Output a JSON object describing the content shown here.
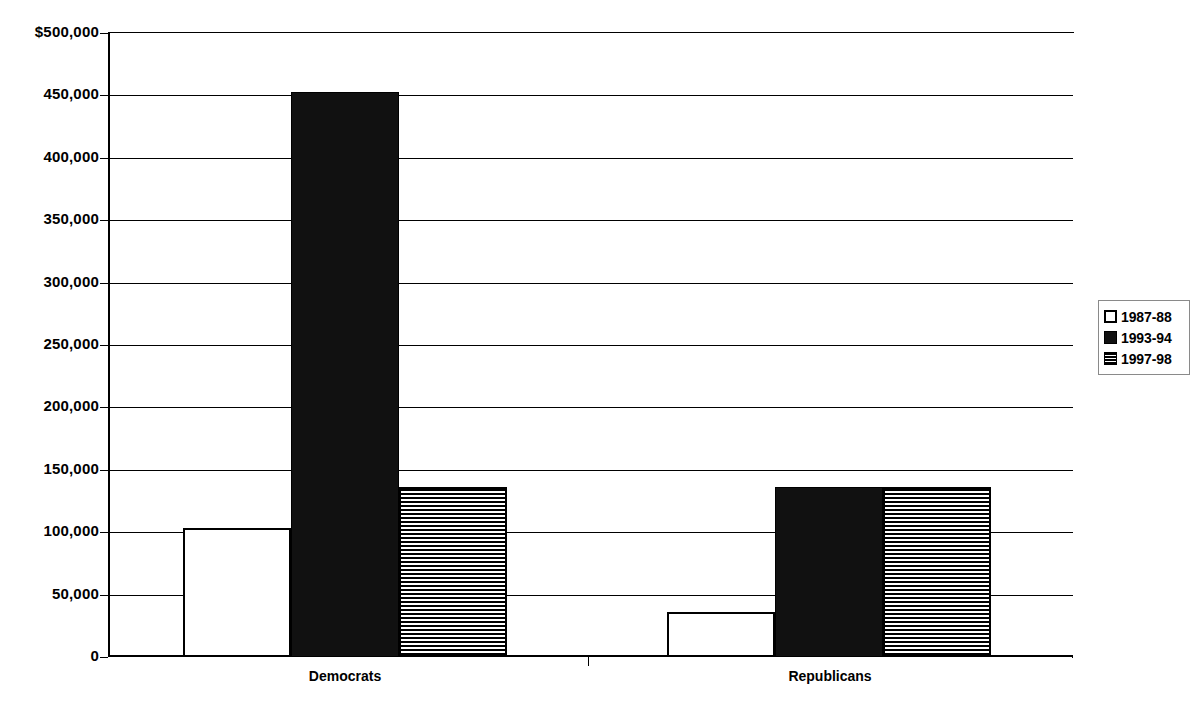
{
  "chart_data": {
    "type": "bar",
    "title": "",
    "xlabel": "",
    "ylabel": "",
    "categories": [
      "Democrats",
      "Republicans"
    ],
    "series": [
      {
        "name": "1987-88",
        "values": [
          103000,
          36000
        ],
        "pattern": "open"
      },
      {
        "name": "1993-94",
        "values": [
          453000,
          136000
        ],
        "pattern": "solid"
      },
      {
        "name": "1997-98",
        "values": [
          136000,
          136000
        ],
        "pattern": "striped"
      }
    ],
    "ylim": [
      0,
      500000
    ],
    "ytick_values": [
      500000,
      450000,
      400000,
      350000,
      300000,
      250000,
      200000,
      150000,
      100000,
      50000,
      0
    ],
    "ytick_labels": [
      "$500,000",
      "450,000",
      "400,000",
      "350,000",
      "300,000",
      "250,000",
      "200,000",
      "150,000",
      "100,000",
      "50,000",
      "0"
    ],
    "grid": true,
    "legend_position": "right"
  },
  "axis": {
    "ticks": [
      {
        "label": "$500,000",
        "value": 500000
      },
      {
        "label": "450,000",
        "value": 450000
      },
      {
        "label": "400,000",
        "value": 400000
      },
      {
        "label": "350,000",
        "value": 350000
      },
      {
        "label": "300,000",
        "value": 300000
      },
      {
        "label": "250,000",
        "value": 250000
      },
      {
        "label": "200,000",
        "value": 200000
      },
      {
        "label": "150,000",
        "value": 150000
      },
      {
        "label": "100,000",
        "value": 100000
      },
      {
        "label": "50,000",
        "value": 50000
      },
      {
        "label": "0",
        "value": 0
      }
    ]
  },
  "categories": [
    {
      "label": "Democrats"
    },
    {
      "label": "Republicans"
    }
  ],
  "legend": {
    "items": [
      {
        "label": "1987-88",
        "pattern": "open"
      },
      {
        "label": "1993-94",
        "pattern": "solid"
      },
      {
        "label": "1997-98",
        "pattern": "striped"
      }
    ]
  },
  "colors": {
    "axis": "#000000",
    "grid": "#000000",
    "solid_fill": "#111111",
    "open_fill": "#ffffff",
    "background": "#ffffff"
  }
}
